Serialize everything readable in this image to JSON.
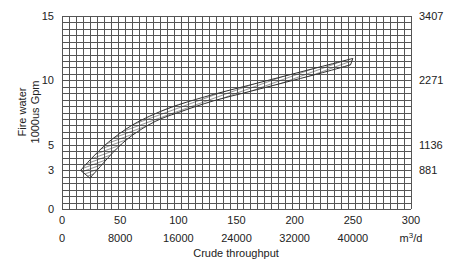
{
  "chart_data": {
    "type": "area",
    "title": "",
    "xlabel": "Crude throughput",
    "ylabel": "Fire water 1000us Gpm",
    "xlim": [
      0,
      300
    ],
    "ylim": [
      0,
      15
    ],
    "grid": true,
    "grid_x_step": 6,
    "grid_y_step": 0.5,
    "x_ticks": [
      0,
      50,
      100,
      150,
      200,
      250,
      300
    ],
    "x_secondary_ticks": [
      {
        "at": 0,
        "label": "0"
      },
      {
        "at": 50,
        "label": "8000"
      },
      {
        "at": 100,
        "label": "16000"
      },
      {
        "at": 150,
        "label": "24000"
      },
      {
        "at": 200,
        "label": "32000"
      },
      {
        "at": 250,
        "label": "40000"
      },
      {
        "at": 300,
        "label": "m3/d"
      }
    ],
    "y_ticks": [
      0,
      3,
      5,
      10,
      15
    ],
    "y_secondary_ticks": [
      {
        "at": 3,
        "label": "881"
      },
      {
        "at": 5,
        "label": "1136"
      },
      {
        "at": 10,
        "label": "2271"
      },
      {
        "at": 15,
        "label": "3407"
      }
    ],
    "series": [
      {
        "name": "Fire water requirement band (upper)",
        "x": [
          16,
          25,
          40,
          60,
          80,
          100,
          130,
          160,
          190,
          220,
          250
        ],
        "values": [
          3.0,
          3.9,
          5.2,
          6.5,
          7.4,
          8.1,
          8.9,
          9.6,
          10.3,
          11.0,
          11.7
        ]
      },
      {
        "name": "Fire water requirement band (lower)",
        "x": [
          24,
          30,
          45,
          60,
          80,
          100,
          130,
          160,
          190,
          220,
          248
        ],
        "values": [
          2.4,
          3.0,
          4.5,
          5.7,
          6.8,
          7.5,
          8.4,
          9.1,
          9.8,
          10.5,
          11.2
        ]
      }
    ],
    "band_fill": "diagonal-hatch"
  },
  "axes": {
    "y_label_line1": "Fire water",
    "y_label_line2": "1000us Gpm",
    "x_label": "Crude throughput",
    "unit_m3d_base": "m",
    "unit_m3d_sup": "3",
    "unit_m3d_tail": "/d"
  },
  "colors": {
    "grid": "#555555",
    "band_stroke": "#333333",
    "text": "#222222"
  }
}
